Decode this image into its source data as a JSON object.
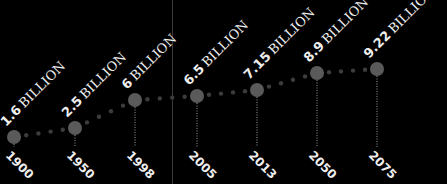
{
  "chart_data": {
    "type": "line",
    "title": "",
    "xlabel": "",
    "ylabel": "",
    "unit": "BILLION",
    "categories": [
      "1900",
      "1950",
      "1998",
      "2005",
      "2013",
      "2050",
      "2075"
    ],
    "values": [
      1.6,
      2.5,
      6,
      6.5,
      7.15,
      8.9,
      9.22
    ],
    "value_labels": [
      "1.6",
      "2.5",
      "6",
      "6.5",
      "7.15",
      "8.9",
      "9.22"
    ],
    "grid": false,
    "legend": null
  },
  "points": [
    {
      "x": 14,
      "y": 137,
      "year": "1900",
      "value": "1.6"
    },
    {
      "x": 75,
      "y": 128,
      "year": "1950",
      "value": "2.5"
    },
    {
      "x": 135,
      "y": 100,
      "year": "1998",
      "value": "6"
    },
    {
      "x": 197,
      "y": 96,
      "year": "2005",
      "value": "6.5"
    },
    {
      "x": 257,
      "y": 90,
      "year": "2013",
      "value": "7.15"
    },
    {
      "x": 317,
      "y": 73,
      "year": "2050",
      "value": "8.9"
    },
    {
      "x": 377,
      "y": 69,
      "year": "2075",
      "value": "9.22"
    }
  ],
  "colors": {
    "background": "#000000",
    "point": "#5a5a5a",
    "dot": "#3c3c3c",
    "text": "#eeeeee",
    "stem": "#9a9a9a"
  }
}
